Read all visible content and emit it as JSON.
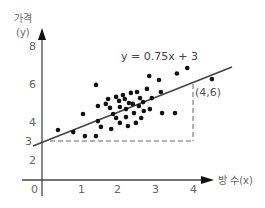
{
  "chart_data": {
    "type": "scatter",
    "title": "",
    "xlabel": "방 수(x)",
    "ylabel_line1": "가격",
    "ylabel_line2": "(y)",
    "x_ticks": [
      "0",
      "1",
      "2",
      "3",
      "4"
    ],
    "y_ticks": [
      "2",
      "3",
      "4",
      "6",
      "8"
    ],
    "xlim": [
      0,
      4.3
    ],
    "ylim": [
      2,
      8.5
    ],
    "grid": false,
    "legend": "none",
    "regression": {
      "equation": "y = 0.75x + 3",
      "slope": 0.75,
      "intercept": 3,
      "x_range": [
        -0.1,
        4.9
      ]
    },
    "annotation": {
      "label": "(4,6)",
      "point": [
        4,
        6
      ],
      "dashed_guides": true
    },
    "points": [
      [
        0.42,
        3.58
      ],
      [
        0.82,
        3.47
      ],
      [
        1.08,
        4.42
      ],
      [
        1.13,
        3.26
      ],
      [
        1.42,
        3.26
      ],
      [
        1.47,
        4.84
      ],
      [
        1.47,
        4.05
      ],
      [
        1.42,
        5.95
      ],
      [
        1.55,
        3.74
      ],
      [
        1.68,
        4.95
      ],
      [
        1.74,
        5.21
      ],
      [
        1.79,
        4.74
      ],
      [
        1.82,
        3.63
      ],
      [
        1.87,
        4.42
      ],
      [
        1.95,
        4.21
      ],
      [
        1.95,
        5.32
      ],
      [
        2.03,
        5.11
      ],
      [
        2.05,
        4.79
      ],
      [
        2.05,
        3.95
      ],
      [
        2.13,
        5.42
      ],
      [
        2.18,
        5.21
      ],
      [
        2.21,
        4.68
      ],
      [
        2.21,
        4.26
      ],
      [
        2.26,
        3.79
      ],
      [
        2.29,
        5.0
      ],
      [
        2.34,
        5.53
      ],
      [
        2.39,
        4.95
      ],
      [
        2.42,
        4.47
      ],
      [
        2.47,
        3.95
      ],
      [
        2.5,
        5.58
      ],
      [
        2.55,
        4.84
      ],
      [
        2.58,
        5.26
      ],
      [
        2.61,
        4.21
      ],
      [
        2.66,
        5.05
      ],
      [
        2.68,
        4.58
      ],
      [
        2.76,
        5.74
      ],
      [
        2.84,
        4.68
      ],
      [
        2.89,
        5.26
      ],
      [
        3.16,
        4.47
      ],
      [
        3.5,
        4.47
      ],
      [
        3.08,
        6.21
      ],
      [
        2.82,
        6.42
      ],
      [
        3.55,
        6.55
      ],
      [
        3.13,
        5.58
      ],
      [
        3.82,
        6.84
      ],
      [
        4.47,
        6.26
      ]
    ]
  }
}
